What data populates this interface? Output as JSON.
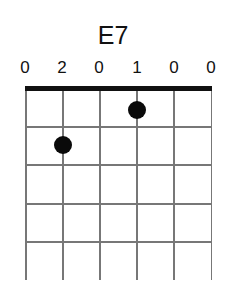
{
  "chord": {
    "name": "E7",
    "fingering": [
      "0",
      "2",
      "0",
      "1",
      "0",
      "0"
    ],
    "strings": 6,
    "frets_shown": 5,
    "dots": [
      {
        "string": 2,
        "fret": 2
      },
      {
        "string": 4,
        "fret": 1
      }
    ]
  }
}
